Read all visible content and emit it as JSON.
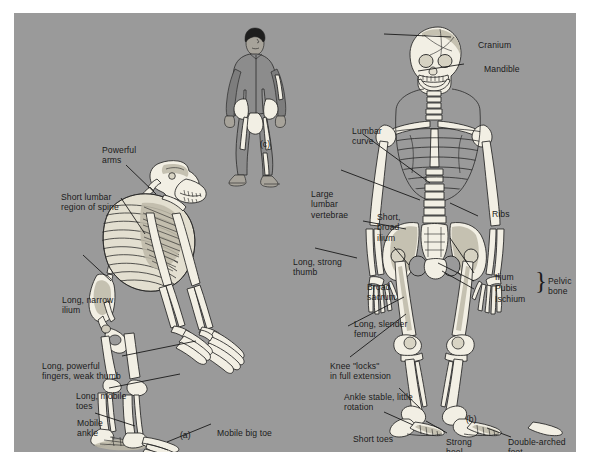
{
  "figure": {
    "background_color": "#9a9a9a",
    "bone_color": "#f2efe4",
    "outline_color": "#1a1a1a",
    "panel_border_color": "#ffffff"
  },
  "subfigures": {
    "ape": {
      "id": "(a)",
      "name": "ape-skeleton"
    },
    "human": {
      "id": "(b)",
      "name": "human-skeleton"
    },
    "walker": {
      "id": "(c)",
      "name": "walking-human-figure"
    }
  },
  "labels": {
    "ape": [
      {
        "key": "powerful_arms",
        "text": "Powerful\narms"
      },
      {
        "key": "short_lumbar",
        "text": "Short lumbar\nregion of spine"
      },
      {
        "key": "long_narrow_ilium",
        "text": "Long, narrow\nilium"
      },
      {
        "key": "long_powerful_fingers",
        "text": "Long, powerful\nfingers, weak thumb"
      },
      {
        "key": "long_mobile_toes",
        "text": "Long, mobile\ntoes"
      },
      {
        "key": "mobile_ankle",
        "text": "Mobile\nankle"
      },
      {
        "key": "mobile_big_toe",
        "text": "Mobile big toe"
      }
    ],
    "human": [
      {
        "key": "cranium",
        "text": "Cranium"
      },
      {
        "key": "mandible",
        "text": "Mandible"
      },
      {
        "key": "lumbar_curve",
        "text": "Lumbar\ncurve"
      },
      {
        "key": "large_lumbar_vertebrae",
        "text": "Large\nlumbar\nvertebrae"
      },
      {
        "key": "ribs",
        "text": "Ribs"
      },
      {
        "key": "short_broad_ilium",
        "text": "Short,\nbroad\nilium"
      },
      {
        "key": "long_strong_thumb",
        "text": "Long, strong\nthumb"
      },
      {
        "key": "broad_sacrum",
        "text": "Broad\nsacrum"
      },
      {
        "key": "ilium",
        "text": "Ilium"
      },
      {
        "key": "pubis",
        "text": "Pubis"
      },
      {
        "key": "ischium",
        "text": "Ischium"
      },
      {
        "key": "pelvic_bone",
        "text": "Pelvic\nbone"
      },
      {
        "key": "long_slender_femur",
        "text": "Long, slender\nfemur"
      },
      {
        "key": "knee_locks",
        "text": "Knee \"locks\"\nin full extension"
      },
      {
        "key": "ankle_stable",
        "text": "Ankle stable, little\nrotation"
      },
      {
        "key": "short_toes",
        "text": "Short toes"
      },
      {
        "key": "strong_heel",
        "text": "Strong\nheel"
      },
      {
        "key": "double_arched_foot",
        "text": "Double-arched\nfoot"
      }
    ]
  },
  "brace_glyph": "}"
}
